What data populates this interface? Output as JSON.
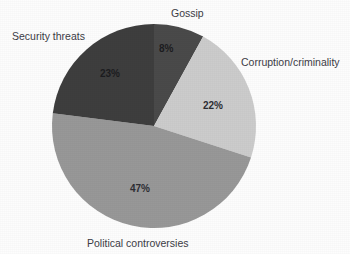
{
  "chart_data": {
    "type": "pie",
    "title": "",
    "subtitle": "",
    "xlabel": "",
    "ylabel": "",
    "legend_position": "none",
    "grid": false,
    "start_angle_deg": 0,
    "direction": "clockwise",
    "categories": [
      "Gossip",
      "Corruption/criminality",
      "Political controversies",
      "Security threats"
    ],
    "values": [
      8,
      22,
      47,
      23
    ],
    "value_unit": "percent",
    "data_labels": [
      "8%",
      "22%",
      "47%",
      "23%"
    ],
    "slice_colors": [
      "#4a4a4a",
      "#cccccc",
      "#989898",
      "#3e3e3e"
    ],
    "slices": [
      {
        "label": "Gossip",
        "value": 8,
        "data_label": "8%",
        "color": "#4a4a4a"
      },
      {
        "label": "Corruption/criminality",
        "value": 22,
        "data_label": "22%",
        "color": "#cccccc"
      },
      {
        "label": "Political controversies",
        "value": 47,
        "data_label": "47%",
        "color": "#989898"
      },
      {
        "label": "Security threats",
        "value": 23,
        "data_label": "23%",
        "color": "#3e3e3e"
      }
    ]
  },
  "figure": {
    "background_color": "#fdfdfd",
    "label_text_color": "#3c3c46",
    "data_label_text_color": "#2e2e34"
  }
}
